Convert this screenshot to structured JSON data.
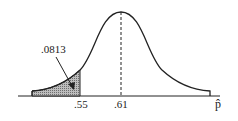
{
  "figure": {
    "type": "normal-distribution-diagram",
    "shaded_area_label": ".0813",
    "x_ticks": [
      ".55",
      ".61"
    ],
    "x_axis_label": "p̂",
    "mean_label": ".61",
    "cutoff_label": ".55",
    "shade_color": "#9a9a9a",
    "line_color": "#222222"
  }
}
